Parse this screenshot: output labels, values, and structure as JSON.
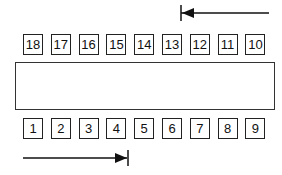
{
  "diagram": {
    "top_row": {
      "labels": [
        "18",
        "17",
        "16",
        "15",
        "14",
        "13",
        "12",
        "11",
        "10"
      ],
      "direction": "right-to-left"
    },
    "bottom_row": {
      "labels": [
        "1",
        "2",
        "3",
        "4",
        "5",
        "6",
        "7",
        "8",
        "9"
      ],
      "direction": "left-to-right"
    },
    "center_rect": {
      "label": ""
    },
    "top_arrow": {
      "direction": "left",
      "icon": "arrow-left-with-stop-bar"
    },
    "bottom_arrow": {
      "direction": "right",
      "icon": "arrow-right-with-stop-bar"
    },
    "colors": {
      "stroke": "#222222",
      "background": "#ffffff"
    }
  }
}
